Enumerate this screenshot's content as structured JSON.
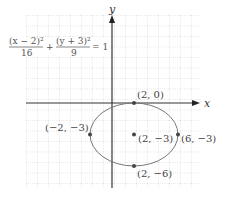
{
  "figure": {
    "equation": {
      "num_left": "(x − 2)²",
      "den_left": "16",
      "plus": "+",
      "num_right": "(y + 3)²",
      "den_right": "9",
      "equals": "= 1"
    },
    "axes": {
      "x_label": "x",
      "y_label": "y"
    },
    "ellipse": {
      "center": [
        2,
        -3
      ],
      "a": 4,
      "b": 3
    },
    "points": [
      {
        "label": "(2, 0)",
        "x": 2,
        "y": 0
      },
      {
        "label": "(−2, −3)",
        "x": -2,
        "y": -3
      },
      {
        "label": "(2, −3)",
        "x": 2,
        "y": -3
      },
      {
        "label": "(6, −3)",
        "x": 6,
        "y": -3
      },
      {
        "label": "(2, −6)",
        "x": 2,
        "y": -6
      }
    ],
    "colors": {
      "curve": "#777777",
      "axis": "#333333",
      "grid": "#bbbbbb",
      "point": "#444444"
    }
  }
}
